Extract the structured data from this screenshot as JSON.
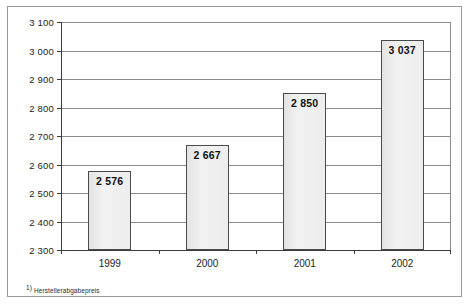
{
  "chart_data": {
    "type": "bar",
    "title": "",
    "subtitle": "",
    "xlabel": "",
    "ylabel": "",
    "categories": [
      "1999",
      "2000",
      "2001",
      "2002"
    ],
    "values": [
      2576,
      2667,
      2850,
      3037
    ],
    "value_labels": [
      "2 576",
      "2 667",
      "2 850",
      "3 037"
    ],
    "ylim": [
      2300,
      3100
    ],
    "yticks": [
      2300,
      2400,
      2500,
      2600,
      2700,
      2800,
      2900,
      3000,
      3100
    ],
    "ytick_labels": [
      "2 300",
      "2 400",
      "2 500",
      "2 600",
      "2 700",
      "2 800",
      "2 900",
      "3 000",
      "3 100"
    ],
    "grid": true,
    "legend": null,
    "series": [
      {
        "name": "Herstellerabgabepreis",
        "values": [
          2576,
          2667,
          2850,
          3037
        ]
      }
    ],
    "annotations": {
      "footnote_marker": "1)",
      "footnote_text": "Herstellerabgabepreis"
    },
    "colors": {
      "bar_fill": "#ececec",
      "bar_border": "#4a4a4a",
      "gridline": "#8c8c8c",
      "axis": "#3b3b3b",
      "frame": "#9a9a9a",
      "text": "#1c1c1c",
      "background": "#ffffff"
    }
  }
}
